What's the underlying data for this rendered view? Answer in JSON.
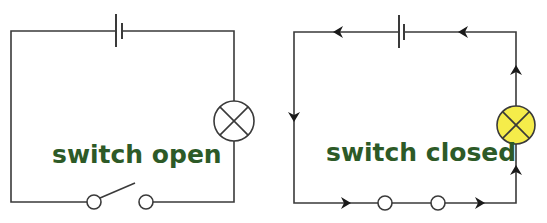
{
  "diagram": {
    "type": "circuit-comparison",
    "colors": {
      "wire": "#3a3a3a",
      "label": "#2d5a27",
      "lamp_off_fill": "#ffffff",
      "lamp_on_fill": "#f5ec4a",
      "arrow": "#1a1a1a"
    },
    "circuits": [
      {
        "id": "open",
        "label": "switch open",
        "components": [
          "battery-cell",
          "lamp-off",
          "switch-open"
        ],
        "current_flow": false
      },
      {
        "id": "closed",
        "label": "switch closed",
        "components": [
          "battery-cell",
          "lamp-on",
          "switch-closed"
        ],
        "current_flow": true,
        "arrow_direction": "anticlockwise"
      }
    ]
  }
}
